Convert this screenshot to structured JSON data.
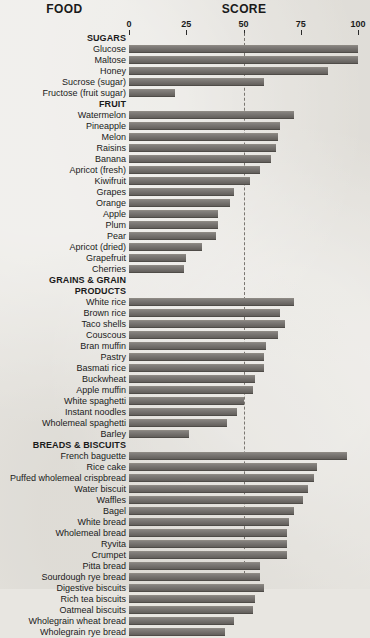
{
  "header": {
    "food_label": "FOOD",
    "score_label": "SCORE"
  },
  "axis": {
    "ticks": [
      "0",
      "25",
      "50",
      "75",
      "100"
    ]
  },
  "chart_data": {
    "type": "bar",
    "orientation": "horizontal",
    "title": "SCORE",
    "xlabel": "SCORE",
    "ylabel": "FOOD",
    "xlim": [
      0,
      100
    ],
    "xticks": [
      0,
      25,
      50,
      75,
      100
    ],
    "grid": false,
    "legend": null,
    "reference_line": {
      "value": 50,
      "style": "dashed"
    },
    "groups": [
      {
        "name": "SUGARS",
        "items": [
          {
            "label": "Glucose",
            "value": 100
          },
          {
            "label": "Maltose",
            "value": 100
          },
          {
            "label": "Honey",
            "value": 87
          },
          {
            "label": "Sucrose (sugar)",
            "value": 59
          },
          {
            "label": "Fructose (fruit sugar)",
            "value": 20
          }
        ]
      },
      {
        "name": "FRUIT",
        "items": [
          {
            "label": "Watermelon",
            "value": 72
          },
          {
            "label": "Pineapple",
            "value": 66
          },
          {
            "label": "Melon",
            "value": 65
          },
          {
            "label": "Raisins",
            "value": 64
          },
          {
            "label": "Banana",
            "value": 62
          },
          {
            "label": "Apricot (fresh)",
            "value": 57
          },
          {
            "label": "Kiwifruit",
            "value": 53
          },
          {
            "label": "Grapes",
            "value": 46
          },
          {
            "label": "Orange",
            "value": 44
          },
          {
            "label": "Apple",
            "value": 39
          },
          {
            "label": "Plum",
            "value": 39
          },
          {
            "label": "Pear",
            "value": 38
          },
          {
            "label": "Apricot (dried)",
            "value": 32
          },
          {
            "label": "Grapefruit",
            "value": 25
          },
          {
            "label": "Cherries",
            "value": 24
          }
        ]
      },
      {
        "name": "GRAINS & GRAIN PRODUCTS",
        "name_lines": [
          "GRAINS & GRAIN",
          "PRODUCTS"
        ],
        "items": [
          {
            "label": "White rice",
            "value": 72
          },
          {
            "label": "Brown rice",
            "value": 66
          },
          {
            "label": "Taco shells",
            "value": 68
          },
          {
            "label": "Couscous",
            "value": 65
          },
          {
            "label": "Bran muffin",
            "value": 60
          },
          {
            "label": "Pastry",
            "value": 59
          },
          {
            "label": "Basmati rice",
            "value": 59
          },
          {
            "label": "Buckwheat",
            "value": 55
          },
          {
            "label": "Apple muffin",
            "value": 54
          },
          {
            "label": "White spaghetti",
            "value": 50
          },
          {
            "label": "Instant noodles",
            "value": 47
          },
          {
            "label": "Wholemeal spaghetti",
            "value": 43
          },
          {
            "label": "Barley",
            "value": 26
          }
        ]
      },
      {
        "name": "BREADS & BISCUITS",
        "items": [
          {
            "label": "French baguette",
            "value": 95
          },
          {
            "label": "Rice cake",
            "value": 82
          },
          {
            "label": "Puffed wholemeal crispbread",
            "value": 81
          },
          {
            "label": "Water biscuit",
            "value": 78
          },
          {
            "label": "Waffles",
            "value": 76
          },
          {
            "label": "Bagel",
            "value": 72
          },
          {
            "label": "White bread",
            "value": 70
          },
          {
            "label": "Wholemeal bread",
            "value": 69
          },
          {
            "label": "Ryvita",
            "value": 69
          },
          {
            "label": "Crumpet",
            "value": 69
          },
          {
            "label": "Pitta bread",
            "value": 57
          },
          {
            "label": "Sourdough rye bread",
            "value": 57
          },
          {
            "label": "Digestive biscuits",
            "value": 59
          },
          {
            "label": "Rich tea biscuits",
            "value": 55
          },
          {
            "label": "Oatmeal biscuits",
            "value": 54
          },
          {
            "label": "Wholegrain wheat bread",
            "value": 46
          },
          {
            "label": "Wholegrain rye bread",
            "value": 42
          }
        ]
      }
    ]
  },
  "colors": {
    "bar": "#6e6a66",
    "background": "#e8e6e1",
    "text": "#1a1a1a",
    "midline": "#6e6a64"
  }
}
